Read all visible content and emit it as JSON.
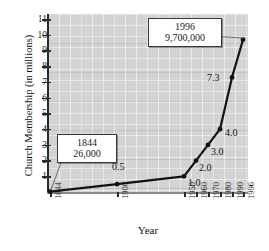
{
  "chart_data": {
    "type": "line",
    "title": "",
    "xlabel": "Year",
    "ylabel": "Church Membership (in millions)",
    "categories": [
      "1844",
      "1900",
      "1950",
      "1960",
      "1970",
      "1980",
      "1990",
      "1996"
    ],
    "x": [
      1844,
      1900,
      1950,
      1960,
      1970,
      1980,
      1990,
      1996
    ],
    "values": [
      0.026,
      0.5,
      1.0,
      2.0,
      3.0,
      4.0,
      7.3,
      9.7
    ],
    "point_labels": [
      "",
      "0.5",
      "1.0",
      "2.0",
      "3.0",
      "4.0",
      "7.3",
      ""
    ],
    "ylim": [
      0,
      11.6
    ],
    "yticks": [
      1,
      2,
      3,
      4,
      5,
      6,
      7,
      8,
      9,
      10,
      11
    ],
    "xticks": [
      "1844",
      "1900",
      "1950",
      "1960",
      "1970",
      "1980",
      "1990",
      "1996"
    ],
    "grid": true,
    "legend": "none",
    "series_color": "#121212",
    "panel_color": "#d3d3d3",
    "annotations": [
      {
        "name": "1844",
        "year": "1844",
        "value": "26,000"
      },
      {
        "name": "1996",
        "year": "1996",
        "value": "9,700,000"
      }
    ]
  },
  "axes": {
    "y_title": "Church Membership (in millions)",
    "x_title": "Year",
    "y_tick_labels": [
      "11",
      "10",
      "9",
      "8",
      "7",
      "6",
      "5",
      "4",
      "3",
      "2",
      "1"
    ],
    "x_tick_labels": [
      "1844",
      "1900",
      "1950",
      "1960",
      "1970",
      "1980",
      "1990",
      "1996"
    ]
  },
  "point_labels": {
    "p1900": "0.5",
    "p1950": "1.0",
    "p1960": "2.0",
    "p1970": "3.0",
    "p1980": "4.0",
    "p1990": "7.3"
  },
  "callouts": {
    "first": {
      "year": "1844",
      "value": "26,000"
    },
    "last": {
      "year": "1996",
      "value": "9,700,000"
    }
  }
}
